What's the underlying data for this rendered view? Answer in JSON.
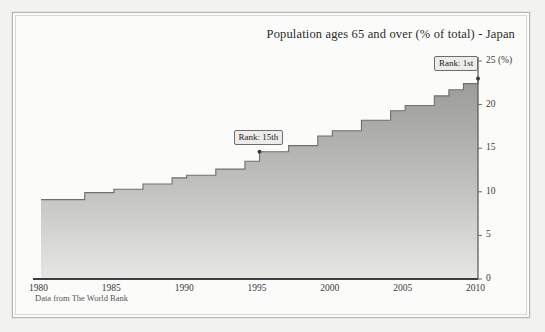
{
  "footnote": "Data from The World Bank",
  "annotations": [
    {
      "name": "rank-15th",
      "label": "Rank: 15th",
      "year": 1995,
      "value": 14.6
    },
    {
      "name": "rank-1st",
      "label": "Rank: 1st",
      "year": 2010,
      "value": 23.0
    }
  ],
  "axis": {
    "y_unit": "(%)",
    "y_top_label": "25 (%)",
    "y_ticks": [
      "0",
      "5",
      "10",
      "15",
      "20",
      "25"
    ],
    "x_ticks": [
      "1980",
      "1985",
      "1990",
      "1995",
      "2000",
      "2005",
      "2010"
    ]
  },
  "colors": {
    "area_top": "#9a9a98",
    "area_bottom": "#e2e2e0",
    "line": "#6f6f6d",
    "axis": "#4a4a48",
    "paper": "#fbfbfa",
    "frame": "#b6b6b4",
    "text": "#2b2b2b"
  },
  "chart_data": {
    "type": "area",
    "title": "Population ages 65 and over (% of total) - Japan",
    "subtitle": "",
    "xlabel": "",
    "ylabel": "(%)",
    "xlim": [
      1980,
      2010
    ],
    "ylim": [
      0,
      25
    ],
    "grid": false,
    "legend": false,
    "step": true,
    "x": [
      1980,
      1981,
      1982,
      1983,
      1984,
      1985,
      1986,
      1987,
      1988,
      1989,
      1990,
      1991,
      1992,
      1993,
      1994,
      1995,
      1996,
      1997,
      1998,
      1999,
      2000,
      2001,
      2002,
      2003,
      2004,
      2005,
      2006,
      2007,
      2008,
      2009,
      2010
    ],
    "series": [
      {
        "name": "Population ages 65 and over (% of total) - Japan",
        "values": [
          9.1,
          9.1,
          9.1,
          9.9,
          9.9,
          10.3,
          10.3,
          10.9,
          10.9,
          11.6,
          11.9,
          11.9,
          12.6,
          12.6,
          13.5,
          14.6,
          14.6,
          15.3,
          15.3,
          16.4,
          17.0,
          17.0,
          18.2,
          18.2,
          19.3,
          19.9,
          19.9,
          21.0,
          21.7,
          22.4,
          23.0
        ]
      }
    ],
    "annotations": [
      {
        "label": "Rank: 15th",
        "x": 1995,
        "y": 14.6
      },
      {
        "label": "Rank: 1st",
        "x": 2010,
        "y": 23.0
      }
    ],
    "source": "Data from The World Bank"
  }
}
